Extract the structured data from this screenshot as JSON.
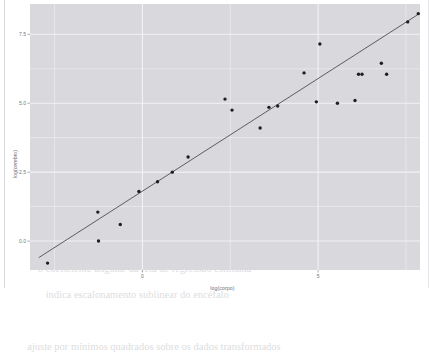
{
  "ghost_text": "                                                                        \n        texto de fundo tênue atrás da figura inserida neste documento\n                                                                        \n                                                                        \n                                                                        \n                                                                        \n               relação alométrica entre massa corporal\n                              e massa encefálica\n                                                                        \n      o coeficiente angular da reta de regressão estimada\n         indica escalonamento sublinear do encéfalo\n                                                                        \n  ajuste por mínimos quadrados sobre os dados transformados",
  "chart_data": {
    "type": "scatter",
    "title": "",
    "xlabel": "log(corpo)",
    "ylabel": "log(cerebro)",
    "xlim": [
      -3.2,
      7.9
    ],
    "ylim": [
      -1.05,
      8.6
    ],
    "xticks": [
      0,
      5
    ],
    "xtick_labels": [
      "0",
      "5"
    ],
    "yticks": [
      0.0,
      2.5,
      5.0,
      7.5
    ],
    "ytick_labels": [
      "0.0",
      "2.5",
      "5.0",
      "7.5"
    ],
    "grid": true,
    "minor_grid": true,
    "panel_background": "#d9d9dd",
    "grid_color": "#f2f2f4",
    "point_color": "#1f1f1f",
    "point_size": 1.7,
    "series": [
      {
        "name": "observações",
        "points": [
          {
            "x": -2.7,
            "y": -0.8
          },
          {
            "x": -1.25,
            "y": 0.0
          },
          {
            "x": -1.27,
            "y": 1.05
          },
          {
            "x": -0.63,
            "y": 0.6
          },
          {
            "x": -0.1,
            "y": 1.8
          },
          {
            "x": 0.43,
            "y": 2.15
          },
          {
            "x": 0.85,
            "y": 2.5
          },
          {
            "x": 1.3,
            "y": 3.05
          },
          {
            "x": 2.55,
            "y": 4.75
          },
          {
            "x": 2.35,
            "y": 5.15
          },
          {
            "x": 3.35,
            "y": 4.1
          },
          {
            "x": 3.6,
            "y": 4.85
          },
          {
            "x": 3.85,
            "y": 4.9
          },
          {
            "x": 4.6,
            "y": 6.1
          },
          {
            "x": 4.95,
            "y": 5.05
          },
          {
            "x": 5.05,
            "y": 7.15
          },
          {
            "x": 5.55,
            "y": 5.0
          },
          {
            "x": 6.05,
            "y": 5.1
          },
          {
            "x": 6.15,
            "y": 6.05
          },
          {
            "x": 6.25,
            "y": 6.05
          },
          {
            "x": 6.8,
            "y": 6.45
          },
          {
            "x": 6.95,
            "y": 6.05
          },
          {
            "x": 7.55,
            "y": 7.95
          },
          {
            "x": 7.85,
            "y": 8.25
          }
        ]
      }
    ],
    "regression_line": {
      "name": "reta de regressão",
      "color": "#4d4d52",
      "width": 0.9,
      "x_start": -2.95,
      "y_start": -0.6,
      "x_end": 7.82,
      "y_end": 8.2
    }
  }
}
